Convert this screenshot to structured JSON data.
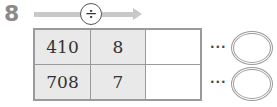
{
  "problem": {
    "number": "8",
    "operation_symbol": "÷",
    "operation": "division",
    "continuation": "···",
    "rows": [
      {
        "dividend": "410",
        "divisor": "8",
        "quotient": "",
        "answer": ""
      },
      {
        "dividend": "708",
        "divisor": "7",
        "quotient": "",
        "answer": ""
      }
    ]
  }
}
